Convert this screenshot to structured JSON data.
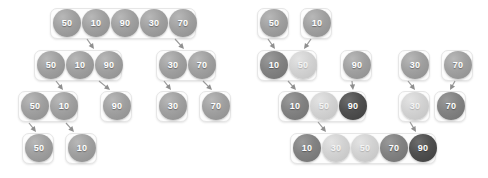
{
  "diagram": {
    "bubble_value_label": "value",
    "tones": {
      "normal": "#a0a0a0",
      "light": "#d2d2d2",
      "mid": "#828282",
      "dark": "#4f4f4f"
    },
    "panels": [
      {
        "id": "split-phase",
        "name": "divide-phase",
        "groups": [
          {
            "id": "L-r1-g1",
            "x": 50,
            "y": 8,
            "w": 146,
            "h": 31,
            "bubbles": [
              {
                "value": "50",
                "x": 53,
                "y": 9,
                "tone": "normal"
              },
              {
                "value": "10",
                "x": 82,
                "y": 9,
                "tone": "normal"
              },
              {
                "value": "90",
                "x": 111,
                "y": 9,
                "tone": "normal"
              },
              {
                "value": "30",
                "x": 140,
                "y": 9,
                "tone": "normal"
              },
              {
                "value": "70",
                "x": 169,
                "y": 9,
                "tone": "normal"
              }
            ]
          },
          {
            "id": "L-r2-g1",
            "x": 34,
            "y": 50,
            "w": 88,
            "h": 31,
            "bubbles": [
              {
                "value": "50",
                "x": 37,
                "y": 51,
                "tone": "normal"
              },
              {
                "value": "10",
                "x": 66,
                "y": 51,
                "tone": "normal"
              },
              {
                "value": "90",
                "x": 95,
                "y": 51,
                "tone": "normal"
              }
            ]
          },
          {
            "id": "L-r2-g2",
            "x": 156,
            "y": 50,
            "w": 60,
            "h": 31,
            "bubbles": [
              {
                "value": "30",
                "x": 159,
                "y": 51,
                "tone": "normal"
              },
              {
                "value": "70",
                "x": 188,
                "y": 51,
                "tone": "normal"
              }
            ]
          },
          {
            "id": "L-r3-g1",
            "x": 18,
            "y": 91,
            "w": 60,
            "h": 31,
            "bubbles": [
              {
                "value": "50",
                "x": 21,
                "y": 92,
                "tone": "normal"
              },
              {
                "value": "10",
                "x": 50,
                "y": 92,
                "tone": "normal"
              }
            ]
          },
          {
            "id": "L-r3-g2",
            "x": 100,
            "y": 91,
            "w": 32,
            "h": 31,
            "bubbles": [
              {
                "value": "90",
                "x": 103,
                "y": 92,
                "tone": "normal"
              }
            ]
          },
          {
            "id": "L-r3-g3",
            "x": 156,
            "y": 91,
            "w": 32,
            "h": 31,
            "bubbles": [
              {
                "value": "30",
                "x": 159,
                "y": 92,
                "tone": "normal"
              }
            ]
          },
          {
            "id": "L-r3-g4",
            "x": 199,
            "y": 91,
            "w": 32,
            "h": 31,
            "bubbles": [
              {
                "value": "70",
                "x": 202,
                "y": 92,
                "tone": "normal"
              }
            ]
          },
          {
            "id": "L-r4-g1",
            "x": 22,
            "y": 133,
            "w": 32,
            "h": 31,
            "bubbles": [
              {
                "value": "50",
                "x": 25,
                "y": 134,
                "tone": "normal"
              }
            ]
          },
          {
            "id": "L-r4-g2",
            "x": 65,
            "y": 133,
            "w": 32,
            "h": 31,
            "bubbles": [
              {
                "value": "10",
                "x": 68,
                "y": 134,
                "tone": "normal"
              }
            ]
          }
        ],
        "arrows": [
          {
            "id": "L-a1",
            "x1": 87,
            "y1": 39,
            "x2": 94,
            "y2": 49
          },
          {
            "id": "L-a2",
            "x1": 175,
            "y1": 39,
            "x2": 184,
            "y2": 49
          },
          {
            "id": "L-a3",
            "x1": 56,
            "y1": 81,
            "x2": 63,
            "y2": 90
          },
          {
            "id": "L-a4",
            "x1": 99,
            "y1": 81,
            "x2": 110,
            "y2": 90
          },
          {
            "id": "L-a5",
            "x1": 164,
            "y1": 81,
            "x2": 171,
            "y2": 90
          },
          {
            "id": "L-a6",
            "x1": 203,
            "y1": 81,
            "x2": 212,
            "y2": 90
          },
          {
            "id": "L-a7",
            "x1": 29,
            "y1": 123,
            "x2": 36,
            "y2": 132
          },
          {
            "id": "L-a8",
            "x1": 66,
            "y1": 123,
            "x2": 74,
            "y2": 132
          }
        ]
      },
      {
        "id": "merge-phase",
        "name": "merge-phase",
        "groups": [
          {
            "id": "R-r1-g1",
            "x": 257,
            "y": 8,
            "w": 32,
            "h": 31,
            "bubbles": [
              {
                "value": "50",
                "x": 260,
                "y": 9,
                "tone": "normal"
              }
            ]
          },
          {
            "id": "R-r1-g2",
            "x": 300,
            "y": 8,
            "w": 32,
            "h": 31,
            "bubbles": [
              {
                "value": "10",
                "x": 303,
                "y": 9,
                "tone": "normal"
              }
            ]
          },
          {
            "id": "R-r2-g1",
            "x": 257,
            "y": 50,
            "w": 60,
            "h": 31,
            "bubbles": [
              {
                "value": "10",
                "x": 260,
                "y": 51,
                "tone": "mid"
              },
              {
                "value": "50",
                "x": 289,
                "y": 51,
                "tone": "light"
              }
            ]
          },
          {
            "id": "R-r2-g2",
            "x": 340,
            "y": 50,
            "w": 32,
            "h": 31,
            "bubbles": [
              {
                "value": "90",
                "x": 343,
                "y": 51,
                "tone": "normal"
              }
            ]
          },
          {
            "id": "R-r2-g3",
            "x": 398,
            "y": 50,
            "w": 32,
            "h": 31,
            "bubbles": [
              {
                "value": "30",
                "x": 401,
                "y": 51,
                "tone": "normal"
              }
            ]
          },
          {
            "id": "R-r2-g4",
            "x": 441,
            "y": 50,
            "w": 32,
            "h": 31,
            "bubbles": [
              {
                "value": "70",
                "x": 444,
                "y": 51,
                "tone": "normal"
              }
            ]
          },
          {
            "id": "R-r3-g1",
            "x": 278,
            "y": 91,
            "w": 88,
            "h": 31,
            "bubbles": [
              {
                "value": "10",
                "x": 281,
                "y": 92,
                "tone": "mid"
              },
              {
                "value": "50",
                "x": 310,
                "y": 92,
                "tone": "light"
              },
              {
                "value": "90",
                "x": 339,
                "y": 92,
                "tone": "dark"
              }
            ]
          },
          {
            "id": "R-r3-g2",
            "x": 398,
            "y": 91,
            "w": 32,
            "h": 31,
            "bubbles": [
              {
                "value": "30",
                "x": 401,
                "y": 92,
                "tone": "light"
              }
            ]
          },
          {
            "id": "R-r3-g3",
            "x": 434,
            "y": 91,
            "w": 32,
            "h": 31,
            "bubbles": [
              {
                "value": "70",
                "x": 437,
                "y": 92,
                "tone": "mid"
              }
            ]
          },
          {
            "id": "R-r4-g1",
            "x": 290,
            "y": 133,
            "w": 146,
            "h": 31,
            "bubbles": [
              {
                "value": "10",
                "x": 293,
                "y": 134,
                "tone": "mid"
              },
              {
                "value": "30",
                "x": 322,
                "y": 134,
                "tone": "light"
              },
              {
                "value": "50",
                "x": 351,
                "y": 134,
                "tone": "light"
              },
              {
                "value": "70",
                "x": 380,
                "y": 134,
                "tone": "mid"
              },
              {
                "value": "90",
                "x": 409,
                "y": 134,
                "tone": "dark"
              }
            ]
          }
        ],
        "arrows": [
          {
            "id": "R-a1",
            "x1": 268,
            "y1": 39,
            "x2": 275,
            "y2": 49
          },
          {
            "id": "R-a2",
            "x1": 311,
            "y1": 39,
            "x2": 304,
            "y2": 49
          },
          {
            "id": "R-a3",
            "x1": 288,
            "y1": 81,
            "x2": 296,
            "y2": 90
          },
          {
            "id": "R-a4",
            "x1": 352,
            "y1": 81,
            "x2": 353,
            "y2": 90
          },
          {
            "id": "R-a5",
            "x1": 408,
            "y1": 81,
            "x2": 415,
            "y2": 90
          },
          {
            "id": "R-a6",
            "x1": 455,
            "y1": 81,
            "x2": 450,
            "y2": 90
          },
          {
            "id": "R-a7",
            "x1": 318,
            "y1": 122,
            "x2": 326,
            "y2": 132
          },
          {
            "id": "R-a8",
            "x1": 410,
            "y1": 122,
            "x2": 416,
            "y2": 132
          }
        ]
      }
    ]
  }
}
